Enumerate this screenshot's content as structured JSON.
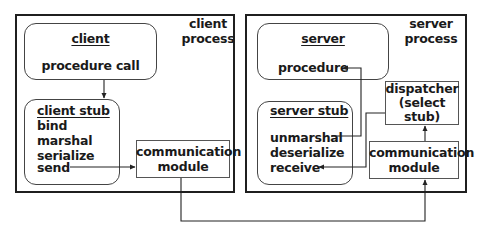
{
  "client_side": {
    "process_label": [
      "client",
      "process"
    ],
    "client_box": {
      "title": "client",
      "item": "procedure call"
    },
    "client_stub": {
      "title": "client stub",
      "items": [
        "bind",
        "marshal",
        "serialize",
        "send"
      ]
    },
    "comm_module": [
      "communication",
      "module"
    ]
  },
  "server_side": {
    "process_label": [
      "server",
      "process"
    ],
    "server_box": {
      "title": "server",
      "item": "procedure"
    },
    "server_stub": {
      "title": "server stub",
      "items": [
        "unmarshal",
        "deserialize",
        "receive"
      ]
    },
    "dispatcher": [
      "dispatcher",
      "(select",
      "stub)"
    ],
    "comm_module": [
      "communication",
      "module"
    ]
  }
}
